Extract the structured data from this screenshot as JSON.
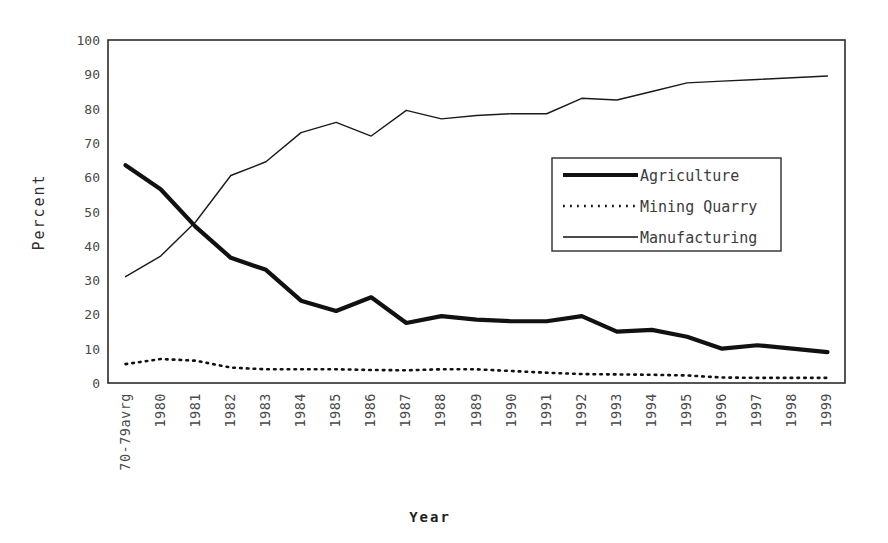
{
  "chart_data": {
    "type": "line",
    "title": "",
    "xlabel": "Year",
    "ylabel": "Percent",
    "ylim": [
      0,
      100
    ],
    "yticks": [
      0,
      10,
      20,
      30,
      40,
      50,
      60,
      70,
      80,
      90,
      100
    ],
    "grid": false,
    "legend_position": "center-right-inside",
    "categories": [
      "70-79avrg",
      "1980",
      "1981",
      "1982",
      "1983",
      "1984",
      "1985",
      "1986",
      "1987",
      "1988",
      "1989",
      "1990",
      "1991",
      "1992",
      "1993",
      "1994",
      "1995",
      "1996",
      "1997",
      "1998",
      "1999"
    ],
    "series": [
      {
        "name": "Agriculture",
        "style": "thick-solid",
        "color": "#111111",
        "values": [
          63.5,
          56.5,
          45.5,
          36.5,
          33.0,
          24.0,
          21.0,
          25.0,
          17.5,
          19.5,
          18.5,
          18.0,
          18.0,
          19.5,
          15.0,
          15.5,
          13.5,
          10.0,
          11.0,
          10.0,
          9.0
        ]
      },
      {
        "name": "Mining Quarry",
        "style": "dotted",
        "color": "#111111",
        "values": [
          5.5,
          7.0,
          6.5,
          4.5,
          4.0,
          4.0,
          4.0,
          3.8,
          3.7,
          4.0,
          4.0,
          3.5,
          3.0,
          2.6,
          2.5,
          2.4,
          2.2,
          1.6,
          1.5,
          1.5,
          1.5
        ]
      },
      {
        "name": "Manufacturing",
        "style": "thin-solid",
        "color": "#1a1a1a",
        "values": [
          31.0,
          37.0,
          47.0,
          60.5,
          64.5,
          73.0,
          76.0,
          72.0,
          79.5,
          77.0,
          78.0,
          78.5,
          78.5,
          83.0,
          82.5,
          85.0,
          87.5,
          88.0,
          88.5,
          89.0,
          89.5
        ]
      }
    ]
  },
  "axes": {
    "y_title": "Percent",
    "x_title": "Year"
  },
  "legend": {
    "items": [
      {
        "label": "Agriculture",
        "swatch": "thick-solid-swatch"
      },
      {
        "label": "Mining Quarry",
        "swatch": "dotted-swatch"
      },
      {
        "label": "Manufacturing",
        "swatch": "thin-solid-swatch"
      }
    ]
  }
}
